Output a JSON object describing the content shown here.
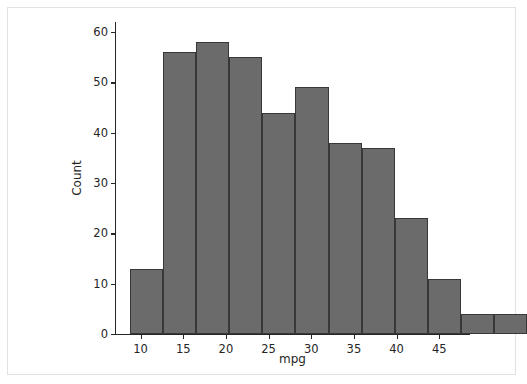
{
  "figure": {
    "background_color": "#ffffff",
    "frame_color": "#e2e2e2",
    "bar_fill_color": "#6b6b6b",
    "bar_edge_color": "#383838",
    "axis_color": "#262626"
  },
  "chart_data": {
    "type": "bar",
    "chart_style": "histogram",
    "title": "",
    "xlabel": "mpg",
    "ylabel": "Count",
    "xlim": [
      7.0,
      48.6
    ],
    "ylim": [
      0,
      62
    ],
    "grid": false,
    "legend": null,
    "xticks": [
      10,
      15,
      20,
      25,
      30,
      35,
      40,
      45
    ],
    "xtick_labels": [
      "10",
      "15",
      "20",
      "25",
      "30",
      "35",
      "40",
      "45"
    ],
    "yticks": [
      0,
      10,
      20,
      30,
      40,
      50,
      60
    ],
    "ytick_labels": [
      "0",
      "10",
      "20",
      "30",
      "40",
      "50",
      "60"
    ],
    "bin_width": 3.87,
    "bin_edges": [
      8.8,
      12.67,
      16.54,
      20.41,
      24.28,
      28.15,
      32.02,
      35.89,
      39.76,
      43.63,
      47.5,
      51.37,
      55.24
    ],
    "bin_centers": [
      10.7,
      14.6,
      18.5,
      22.3,
      26.2,
      30.1,
      34.0,
      37.8,
      41.7,
      45.6
    ],
    "categories": [
      "8.8-12.7",
      "12.7-16.5",
      "16.5-20.4",
      "20.4-24.3",
      "24.3-28.2",
      "28.2-32.0",
      "32.0-35.9",
      "35.9-39.8",
      "39.8-43.6",
      "43.6-47.5"
    ],
    "values": [
      13,
      56,
      58,
      55,
      44,
      49,
      38,
      37,
      23,
      11
    ],
    "bars": [
      {
        "x0": 8.8,
        "x1": 12.67,
        "count": 13
      },
      {
        "x0": 12.67,
        "x1": 16.54,
        "count": 56
      },
      {
        "x0": 16.54,
        "x1": 20.41,
        "count": 58
      },
      {
        "x0": 20.41,
        "x1": 24.28,
        "count": 55
      },
      {
        "x0": 24.28,
        "x1": 28.15,
        "count": 44
      },
      {
        "x0": 28.15,
        "x1": 32.02,
        "count": 49
      },
      {
        "x0": 32.02,
        "x1": 35.89,
        "count": 38
      },
      {
        "x0": 35.89,
        "x1": 39.76,
        "count": 37
      },
      {
        "x0": 39.76,
        "x1": 43.63,
        "count": 23
      },
      {
        "x0": 43.63,
        "x1": 47.5,
        "count": 11
      },
      {
        "x0": 47.5,
        "x1": 51.37,
        "count": 4
      },
      {
        "x0": 51.37,
        "x1": 55.24,
        "count": 4
      }
    ]
  }
}
